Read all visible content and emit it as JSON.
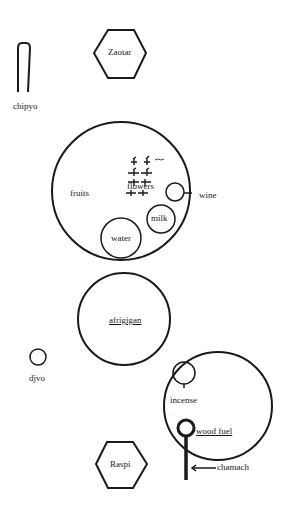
{
  "diagram": {
    "labels": {
      "zaotar": "Zaotar",
      "chipyo": "chipyo",
      "fruits": "fruits",
      "flowers": "flowers",
      "wine": "wine",
      "milk": "milk",
      "water": "water",
      "afrigigan": "afrigigan",
      "djvo": "djvo",
      "incense": "incense",
      "wood_fuel": "wood fuel",
      "chamach": "chamach",
      "raspi": "Raspi"
    },
    "colors": {
      "stroke": "#1a1a1a",
      "background": "#ffffff"
    }
  }
}
